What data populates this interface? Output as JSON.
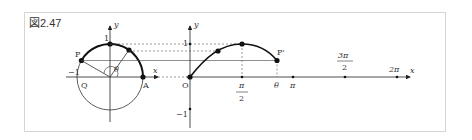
{
  "figure": {
    "label": "図2.47"
  },
  "unit_circle": {
    "labels": {
      "y_axis": "y",
      "x_axis": "x",
      "one": "1",
      "neg_one": "−1",
      "P": "P",
      "Q": "Q",
      "A": "A",
      "theta": "θ"
    }
  },
  "sine_graph": {
    "labels": {
      "y_axis": "y",
      "x_axis": "x",
      "one": "1",
      "neg_one": "−1",
      "origin": "O",
      "P_prime": "P'",
      "pi_over_2_num": "π",
      "pi_over_2_den": "2",
      "theta": "θ",
      "pi": "π",
      "three_pi_over_2_num": "3π",
      "three_pi_over_2_den": "2",
      "two_pi": "2π"
    }
  },
  "colors": {
    "stroke": "#222222",
    "frame": "#d4d4d4",
    "dashed": "#555555"
  }
}
